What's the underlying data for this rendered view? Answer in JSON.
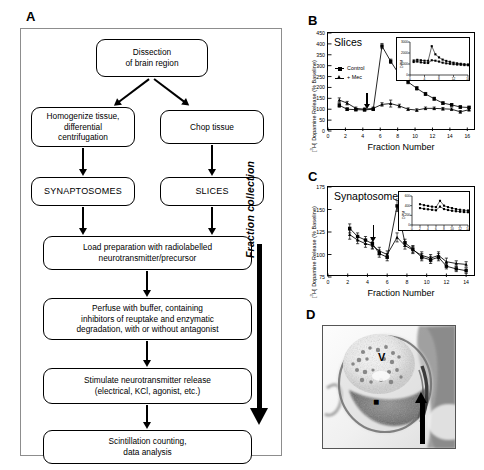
{
  "figure": {
    "panels": [
      "A",
      "B",
      "C",
      "D"
    ]
  },
  "panel_a": {
    "letter": "A",
    "side_arrow_label": "Fraction collection",
    "nodes": [
      {
        "id": "dissection",
        "text": "Dissection\nof brain region"
      },
      {
        "id": "homogenize",
        "text": "Homogenize tissue,\ndifferential\ncentrifugation"
      },
      {
        "id": "chop",
        "text": "Chop tissue"
      },
      {
        "id": "synaptosomes",
        "text": "SYNAPTOSOMES"
      },
      {
        "id": "slices",
        "text": "SLICES"
      },
      {
        "id": "load",
        "text": "Load preparation with radiolabelled\nneurotransmitter/precursor"
      },
      {
        "id": "perfuse",
        "text": "Perfuse with buffer, containing\ninhibitors of reuptake and enzymatic\ndegradation, with or without antagonist"
      },
      {
        "id": "stimulate",
        "text": "Stimulate neurotransmitter release\n(electrical, KCl, agonist, etc.)"
      },
      {
        "id": "scintillation",
        "text": "Scintillation counting,\ndata analysis"
      }
    ]
  },
  "chart_data": [
    {
      "id": "panel_b",
      "letter": "B",
      "type": "line",
      "title": "Slices",
      "xlabel": "Fraction Number",
      "ylabel": "[3H] Dopamine Release (% Baseline)",
      "xlim": [
        0,
        17
      ],
      "ylim": [
        0,
        450
      ],
      "xticks": [
        0,
        2,
        4,
        6,
        8,
        10,
        12,
        14,
        16
      ],
      "yticks": [
        0,
        50,
        100,
        150,
        200,
        250,
        300,
        350,
        400,
        450
      ],
      "grid": false,
      "legend_position": "upper-left",
      "annotation": {
        "label": "stimulation arrow",
        "x": 4.5
      },
      "x": [
        1.3,
        2.2,
        3.2,
        4.2,
        5.2,
        6.2,
        7.2,
        8.2,
        9.2,
        10.2,
        11.2,
        12.2,
        13.2,
        14.2,
        15.2,
        16.2
      ],
      "series": [
        {
          "name": "Control",
          "marker": "square",
          "values": [
            118,
            100,
            98,
            97,
            100,
            390,
            320,
            258,
            225,
            196,
            170,
            148,
            128,
            120,
            110,
            108
          ],
          "errors": [
            9,
            6,
            5,
            5,
            6,
            12,
            10,
            9,
            8,
            8,
            7,
            7,
            6,
            6,
            6,
            6
          ]
        },
        {
          "name": "+ Mec",
          "marker": "triangle",
          "values": [
            142,
            128,
            104,
            100,
            104,
            122,
            126,
            115,
            100,
            96,
            104,
            104,
            102,
            100,
            88,
            98
          ],
          "errors": [
            10,
            8,
            6,
            6,
            6,
            8,
            16,
            8,
            6,
            6,
            6,
            6,
            6,
            6,
            6,
            7
          ]
        }
      ],
      "inset": {
        "type": "line",
        "ylabel": "DPM",
        "xlim": [
          0,
          16
        ],
        "ylim": [
          0,
          3000
        ],
        "xticks": [
          0,
          4,
          8,
          12,
          16
        ],
        "yticks": [
          0,
          1000,
          2000,
          3000
        ],
        "x": [
          1,
          2,
          3,
          4,
          5,
          6,
          7,
          8,
          9,
          10,
          11,
          12,
          13,
          14,
          15,
          16
        ],
        "series": [
          {
            "name": "Control",
            "marker": "square",
            "values": [
              1320,
              1380,
              1340,
              1300,
              1290,
              2620,
              1880,
              1600,
              1400,
              1280,
              1200,
              1120,
              1060,
              1020,
              980,
              960
            ]
          },
          {
            "name": "+ Mec",
            "marker": "square",
            "values": [
              1180,
              1220,
              1150,
              1100,
              1090,
              1340,
              1300,
              1220,
              1120,
              1060,
              1020,
              980,
              950,
              930,
              900,
              890
            ]
          }
        ]
      }
    },
    {
      "id": "panel_c",
      "letter": "C",
      "type": "line",
      "title": "Synaptosomes",
      "xlabel": "Fraction Number",
      "ylabel": "[3H] Dopamine Release (% Baseline)",
      "xlim": [
        0,
        15
      ],
      "ylim": [
        75,
        175
      ],
      "xticks": [
        0,
        2,
        4,
        6,
        8,
        10,
        12,
        14
      ],
      "yticks": [
        75,
        100,
        125,
        150,
        175
      ],
      "grid": false,
      "annotation": {
        "label": "stimulation arrow",
        "x": 4.6
      },
      "x": [
        2.2,
        3.0,
        3.8,
        4.5,
        5.2,
        6.0,
        7.0,
        7.8,
        8.6,
        9.5,
        10.4,
        11.2,
        12.0,
        13.0,
        14.0
      ],
      "series": [
        {
          "name": "Control",
          "marker": "square",
          "values": [
            129,
            120,
            116,
            112,
            101,
            97,
            154,
            113,
            106,
            97,
            94,
            97,
            87,
            84,
            82
          ],
          "errors": [
            5,
            4,
            4,
            5,
            4,
            4,
            6,
            4,
            4,
            4,
            4,
            4,
            3,
            3,
            3
          ]
        },
        {
          "name": "+ Mec",
          "marker": "triangle",
          "values": [
            122,
            116,
            112,
            110,
            104,
            100,
            119,
            110,
            105,
            99,
            96,
            99,
            92,
            90,
            89
          ],
          "errors": [
            5,
            4,
            4,
            4,
            4,
            4,
            5,
            4,
            4,
            4,
            4,
            4,
            4,
            3,
            3
          ]
        }
      ],
      "inset": {
        "type": "line",
        "ylabel": "DPM",
        "xlim": [
          0,
          14
        ],
        "ylim": [
          0,
          600
        ],
        "xticks": [
          0,
          2,
          4,
          6,
          8,
          10,
          12,
          14
        ],
        "yticks": [
          0,
          200,
          400,
          600
        ],
        "x": [
          2,
          3,
          4,
          5,
          6,
          7,
          8,
          9,
          10,
          11,
          12,
          13,
          14
        ],
        "series": [
          {
            "name": "Control",
            "marker": "square",
            "values": [
              430,
              410,
              395,
              380,
              370,
              500,
              400,
              370,
              350,
              330,
              315,
              305,
              300
            ]
          },
          {
            "name": "+ Mec",
            "marker": "square",
            "values": [
              350,
              335,
              325,
              315,
              305,
              380,
              330,
              310,
              295,
              285,
              275,
              268,
              265
            ]
          }
        ]
      }
    }
  ],
  "panel_d": {
    "letter": "D",
    "markers": [
      {
        "id": "vesicle-marker",
        "label": "V"
      },
      {
        "id": "square-marker",
        "label": "■"
      },
      {
        "id": "pointer-arrow",
        "label": "arrow"
      }
    ]
  }
}
